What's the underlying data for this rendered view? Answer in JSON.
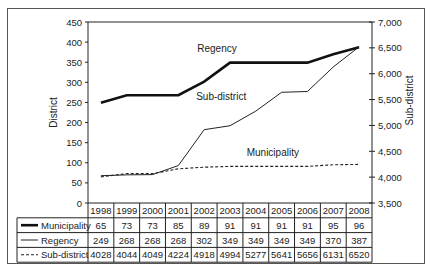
{
  "chart_data": {
    "type": "line",
    "title": "",
    "x": [
      "1998",
      "1999",
      "2000",
      "2001",
      "2002",
      "2003",
      "2004",
      "2005",
      "2006",
      "2007",
      "2008"
    ],
    "ylabel": "District",
    "y2label": "Sub-district",
    "ylim": [
      0,
      450
    ],
    "y2lim": [
      3500,
      7000
    ],
    "yticks": [
      "0",
      "50",
      "100",
      "150",
      "200",
      "250",
      "300",
      "350",
      "400",
      "450"
    ],
    "y2ticks": [
      "3,500",
      "4,000",
      "4,500",
      "5,000",
      "5,500",
      "6,000",
      "6,500",
      "7,000"
    ],
    "grid": false,
    "series": [
      {
        "name": "Municipality",
        "axis": "left",
        "style": "dashed",
        "values": [
          65,
          73,
          73,
          85,
          89,
          91,
          91,
          91,
          91,
          95,
          96
        ]
      },
      {
        "name": "Regency",
        "axis": "left",
        "style": "thick",
        "values": [
          249,
          268,
          268,
          268,
          302,
          349,
          349,
          349,
          349,
          370,
          387
        ]
      },
      {
        "name": "Sub-district",
        "axis": "right",
        "style": "thin",
        "values": [
          4028,
          4044,
          4049,
          4224,
          4918,
          4994,
          5277,
          5641,
          5656,
          6131,
          6520
        ]
      }
    ],
    "line_labels": [
      {
        "text": "Regency",
        "series": "Regency"
      },
      {
        "text": "Sub-district",
        "series": "Sub-district"
      },
      {
        "text": "Municipality",
        "series": "Municipality"
      }
    ],
    "table": {
      "header": [
        "1998",
        "1999",
        "2000",
        "2001",
        "2002",
        "2003",
        "2004",
        "2005",
        "2006",
        "2007",
        "2008"
      ],
      "rows": [
        {
          "label": "Municipality",
          "legend_style": "thick",
          "values": [
            "65",
            "73",
            "73",
            "85",
            "89",
            "91",
            "91",
            "91",
            "91",
            "95",
            "96"
          ]
        },
        {
          "label": "Regency",
          "legend_style": "thin",
          "values": [
            "249",
            "268",
            "268",
            "268",
            "302",
            "349",
            "349",
            "349",
            "349",
            "370",
            "387"
          ]
        },
        {
          "label": "Sub-district",
          "legend_style": "dashed",
          "values": [
            "4028",
            "4044",
            "4049",
            "4224",
            "4918",
            "4994",
            "5277",
            "5641",
            "5656",
            "6131",
            "6520"
          ]
        }
      ]
    }
  }
}
